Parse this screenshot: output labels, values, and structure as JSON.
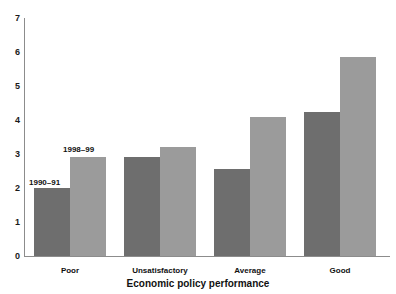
{
  "chart_data": {
    "type": "bar",
    "title": "",
    "xlabel": "Economic policy performance",
    "ylabel": "",
    "categories": [
      "Poor",
      "Unsatisfactory",
      "Average",
      "Good"
    ],
    "series": [
      {
        "name": "1990–91",
        "color": "#6e6e6e",
        "values": [
          2.0,
          2.9,
          2.55,
          4.25
        ]
      },
      {
        "name": "1998–99",
        "color": "#9b9b9b",
        "values": [
          2.9,
          3.2,
          4.1,
          5.85
        ]
      }
    ],
    "ylim": [
      0,
      7
    ],
    "ytick_labels": [
      "7",
      "6",
      "5",
      "4",
      "3",
      "2",
      "1",
      "0"
    ],
    "ytick_values": [
      7,
      6,
      5,
      4,
      3,
      2,
      1,
      0
    ],
    "grid": false,
    "legend": "inline-annotations",
    "annotations": [
      {
        "text": "1990–91",
        "series": 0,
        "category": "Poor"
      },
      {
        "text": "1998–99",
        "series": 1,
        "category": "Poor"
      }
    ]
  }
}
